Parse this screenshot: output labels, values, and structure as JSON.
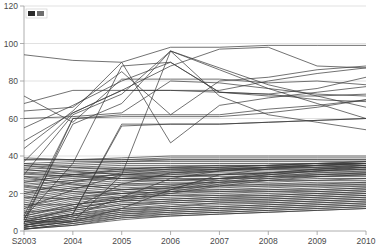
{
  "chart_data": {
    "type": "line",
    "title": "",
    "subtitle": "",
    "xlabel": "",
    "ylabel": "",
    "grid": true,
    "legend_position": "top-left",
    "legend_entries": [
      "series"
    ],
    "x": [
      "S2003",
      "2004",
      "2005",
      "2006",
      "2007",
      "2008",
      "2009",
      "2010"
    ],
    "xtick_labels": [
      "S2003",
      "2004",
      "2005",
      "2006",
      "2007",
      "2008",
      "2009",
      "2010"
    ],
    "ytick_labels": [
      "0",
      "20",
      "40",
      "60",
      "80",
      "100",
      "120"
    ],
    "ytick_values": [
      0,
      20,
      40,
      60,
      80,
      100,
      120
    ],
    "ylim": [
      0,
      120
    ],
    "xlim": [
      0,
      7
    ],
    "line_color": "#3a3a3a",
    "grid_color": "#d4d4d4",
    "axis_color": "#9a9a9a",
    "background": "#ffffff",
    "series": [
      {
        "name": "s01",
        "values": [
          94,
          91,
          90,
          98,
          98,
          99,
          99,
          99
        ]
      },
      {
        "name": "s02",
        "values": [
          68,
          75,
          75,
          88,
          97,
          98,
          88,
          87
        ]
      },
      {
        "name": "s03",
        "values": [
          64,
          66,
          85,
          62,
          80,
          82,
          86,
          88
        ]
      },
      {
        "name": "s04",
        "values": [
          72,
          58,
          81,
          81,
          81,
          79,
          80,
          78
        ]
      },
      {
        "name": "s05",
        "values": [
          55,
          67,
          80,
          90,
          74,
          73,
          76,
          82
        ]
      },
      {
        "name": "s06",
        "values": [
          48,
          63,
          75,
          75,
          75,
          80,
          84,
          87
        ]
      },
      {
        "name": "s07",
        "values": [
          37,
          63,
          75,
          75,
          74,
          73,
          70,
          69
        ]
      },
      {
        "name": "s08",
        "values": [
          60,
          61,
          63,
          80,
          79,
          76,
          73,
          72
        ]
      },
      {
        "name": "s09",
        "values": [
          44,
          64,
          90,
          47,
          67,
          71,
          74,
          77
        ]
      },
      {
        "name": "s10",
        "values": [
          30,
          62,
          73,
          96,
          72,
          62,
          58,
          54
        ]
      },
      {
        "name": "s11",
        "values": [
          8,
          60,
          62,
          62,
          62,
          65,
          67,
          70
        ]
      },
      {
        "name": "s12",
        "values": [
          6,
          57,
          68,
          96,
          87,
          78,
          72,
          66
        ]
      },
      {
        "name": "s13",
        "values": [
          5,
          9,
          56,
          57,
          57,
          58,
          59,
          60
        ]
      },
      {
        "name": "s14",
        "values": [
          39,
          38,
          39,
          40,
          40,
          40,
          40,
          40
        ]
      },
      {
        "name": "s15",
        "values": [
          38,
          38,
          38,
          39,
          39,
          39,
          39,
          39
        ]
      },
      {
        "name": "s16",
        "values": [
          36,
          37,
          37,
          38,
          38,
          38,
          38,
          38
        ]
      },
      {
        "name": "s17",
        "values": [
          35,
          36,
          37,
          37,
          37,
          37,
          37,
          37
        ]
      },
      {
        "name": "s18",
        "values": [
          34,
          35,
          36,
          36,
          36,
          36,
          36,
          36
        ]
      },
      {
        "name": "s19",
        "values": [
          33,
          34,
          35,
          35,
          35,
          35,
          36,
          36
        ]
      },
      {
        "name": "s20",
        "values": [
          32,
          33,
          34,
          34,
          35,
          35,
          35,
          35
        ]
      },
      {
        "name": "s21",
        "values": [
          31,
          32,
          33,
          34,
          34,
          34,
          34,
          34
        ]
      },
      {
        "name": "s22",
        "values": [
          30,
          31,
          32,
          33,
          33,
          33,
          33,
          34
        ]
      },
      {
        "name": "s23",
        "values": [
          29,
          30,
          32,
          32,
          32,
          33,
          33,
          33
        ]
      },
      {
        "name": "s24",
        "values": [
          28,
          30,
          31,
          31,
          32,
          32,
          32,
          33
        ]
      },
      {
        "name": "s25",
        "values": [
          27,
          29,
          30,
          31,
          31,
          31,
          32,
          32
        ]
      },
      {
        "name": "s26",
        "values": [
          26,
          28,
          30,
          30,
          30,
          31,
          31,
          31
        ]
      },
      {
        "name": "s27",
        "values": [
          25,
          27,
          29,
          29,
          30,
          30,
          30,
          31
        ]
      },
      {
        "name": "s28",
        "values": [
          24,
          27,
          28,
          29,
          29,
          29,
          30,
          30
        ]
      },
      {
        "name": "s29",
        "values": [
          23,
          26,
          28,
          28,
          28,
          29,
          29,
          30
        ]
      },
      {
        "name": "s30",
        "values": [
          22,
          25,
          27,
          27,
          28,
          28,
          29,
          29
        ]
      },
      {
        "name": "s31",
        "values": [
          21,
          24,
          26,
          27,
          27,
          27,
          28,
          28
        ]
      },
      {
        "name": "s32",
        "values": [
          20,
          23,
          25,
          26,
          26,
          27,
          27,
          28
        ]
      },
      {
        "name": "s33",
        "values": [
          19,
          23,
          25,
          25,
          26,
          26,
          27,
          27
        ]
      },
      {
        "name": "s34",
        "values": [
          18,
          22,
          24,
          25,
          25,
          25,
          26,
          26
        ]
      },
      {
        "name": "s35",
        "values": [
          17,
          21,
          23,
          24,
          24,
          25,
          25,
          26
        ]
      },
      {
        "name": "s36",
        "values": [
          16,
          20,
          22,
          23,
          24,
          24,
          25,
          25
        ]
      },
      {
        "name": "s37",
        "values": [
          15,
          19,
          22,
          23,
          23,
          24,
          24,
          25
        ]
      },
      {
        "name": "s38",
        "values": [
          14,
          18,
          21,
          22,
          22,
          23,
          24,
          24
        ]
      },
      {
        "name": "s39",
        "values": [
          13,
          18,
          20,
          21,
          22,
          22,
          23,
          24
        ]
      },
      {
        "name": "s40",
        "values": [
          12,
          17,
          20,
          21,
          21,
          22,
          22,
          23
        ]
      },
      {
        "name": "s41",
        "values": [
          11,
          16,
          19,
          20,
          21,
          21,
          22,
          23
        ]
      },
      {
        "name": "s42",
        "values": [
          10,
          15,
          18,
          19,
          20,
          21,
          21,
          22
        ]
      },
      {
        "name": "s43",
        "values": [
          9,
          14,
          18,
          19,
          19,
          20,
          21,
          22
        ]
      },
      {
        "name": "s44",
        "values": [
          8,
          14,
          17,
          18,
          19,
          19,
          20,
          21
        ]
      },
      {
        "name": "s45",
        "values": [
          8,
          13,
          16,
          17,
          18,
          19,
          20,
          21
        ]
      },
      {
        "name": "s46",
        "values": [
          7,
          12,
          16,
          17,
          18,
          18,
          19,
          20
        ]
      },
      {
        "name": "s47",
        "values": [
          7,
          11,
          15,
          16,
          17,
          18,
          19,
          20
        ]
      },
      {
        "name": "s48",
        "values": [
          6,
          11,
          14,
          16,
          17,
          17,
          18,
          19
        ]
      },
      {
        "name": "s49",
        "values": [
          6,
          10,
          14,
          15,
          16,
          17,
          18,
          19
        ]
      },
      {
        "name": "s50",
        "values": [
          5,
          9,
          13,
          15,
          16,
          16,
          17,
          18
        ]
      },
      {
        "name": "s51",
        "values": [
          5,
          9,
          12,
          14,
          15,
          16,
          17,
          18
        ]
      },
      {
        "name": "s52",
        "values": [
          4,
          8,
          12,
          13,
          15,
          15,
          16,
          17
        ]
      },
      {
        "name": "s53",
        "values": [
          4,
          8,
          11,
          13,
          14,
          15,
          16,
          17
        ]
      },
      {
        "name": "s54",
        "values": [
          3,
          7,
          11,
          12,
          13,
          14,
          15,
          16
        ]
      },
      {
        "name": "s55",
        "values": [
          3,
          7,
          10,
          12,
          13,
          14,
          15,
          16
        ]
      },
      {
        "name": "s56",
        "values": [
          3,
          6,
          10,
          11,
          12,
          13,
          14,
          15
        ]
      },
      {
        "name": "s57",
        "values": [
          2,
          6,
          9,
          11,
          12,
          13,
          14,
          15
        ]
      },
      {
        "name": "s58",
        "values": [
          2,
          5,
          9,
          10,
          11,
          12,
          13,
          14
        ]
      },
      {
        "name": "s59",
        "values": [
          2,
          5,
          8,
          10,
          11,
          12,
          13,
          14
        ]
      },
      {
        "name": "s60",
        "values": [
          1,
          4,
          8,
          9,
          10,
          11,
          12,
          13
        ]
      },
      {
        "name": "s61",
        "values": [
          1,
          4,
          7,
          9,
          10,
          11,
          12,
          13
        ]
      },
      {
        "name": "s62",
        "values": [
          1,
          3,
          7,
          8,
          9,
          10,
          11,
          12
        ]
      },
      {
        "name": "s63",
        "values": [
          1,
          3,
          6,
          8,
          9,
          10,
          11,
          12
        ]
      },
      {
        "name": "s64",
        "values": [
          38,
          38,
          38,
          38,
          38,
          38,
          38,
          38
        ]
      },
      {
        "name": "s65",
        "values": [
          26,
          30,
          33,
          34,
          34,
          35,
          36,
          37
        ]
      },
      {
        "name": "s66",
        "values": [
          33,
          30,
          28,
          27,
          28,
          30,
          32,
          34
        ]
      },
      {
        "name": "s67",
        "values": [
          20,
          26,
          31,
          33,
          33,
          34,
          34,
          35
        ]
      },
      {
        "name": "s68",
        "values": [
          35,
          32,
          30,
          29,
          30,
          31,
          33,
          35
        ]
      },
      {
        "name": "s69",
        "values": [
          12,
          22,
          30,
          32,
          33,
          33,
          34,
          35
        ]
      },
      {
        "name": "s70",
        "values": [
          5,
          12,
          25,
          31,
          33,
          34,
          35,
          36
        ]
      },
      {
        "name": "s71",
        "values": [
          3,
          8,
          18,
          28,
          32,
          34,
          35,
          36
        ]
      },
      {
        "name": "s72",
        "values": [
          2,
          5,
          12,
          22,
          30,
          33,
          35,
          36
        ]
      },
      {
        "name": "s73",
        "values": [
          29,
          25,
          22,
          24,
          28,
          31,
          33,
          34
        ]
      },
      {
        "name": "s74",
        "values": [
          24,
          21,
          20,
          23,
          27,
          30,
          32,
          33
        ]
      },
      {
        "name": "s75",
        "values": [
          18,
          17,
          18,
          22,
          26,
          29,
          31,
          32
        ]
      },
      {
        "name": "s76",
        "values": [
          14,
          14,
          17,
          21,
          25,
          28,
          30,
          31
        ]
      },
      {
        "name": "s77",
        "values": [
          10,
          12,
          16,
          20,
          24,
          27,
          29,
          30
        ]
      },
      {
        "name": "s78",
        "values": [
          36,
          34,
          33,
          33,
          34,
          35,
          36,
          37
        ]
      },
      {
        "name": "s79",
        "values": [
          31,
          29,
          28,
          30,
          32,
          34,
          35,
          36
        ]
      }
    ],
    "steep_risers": [
      {
        "name": "r1",
        "values": [
          4,
          60,
          61,
          61,
          61,
          63,
          66,
          70
        ]
      },
      {
        "name": "r2",
        "values": [
          3,
          9,
          57,
          57,
          57,
          58,
          59,
          60
        ]
      },
      {
        "name": "r3",
        "values": [
          5,
          5,
          30,
          96,
          86,
          76,
          68,
          60
        ]
      },
      {
        "name": "r4",
        "values": [
          7,
          36,
          88,
          90,
          74,
          72,
          72,
          73
        ]
      }
    ]
  },
  "legend": {
    "marker_label": "",
    "swatch_colors": [
      "#2b2b2b",
      "#6e6e6e"
    ]
  }
}
